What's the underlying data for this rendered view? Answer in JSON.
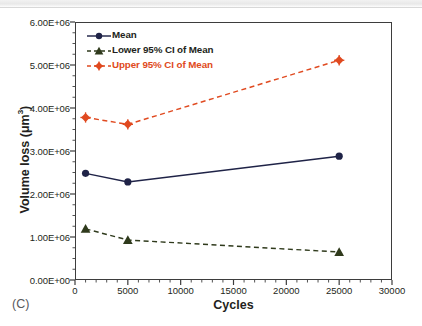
{
  "panel": {
    "label": "(C)"
  },
  "chart_data": {
    "type": "line",
    "title": "",
    "subtitle": "",
    "xlabel": "Cycles",
    "ylabel": "Volume loss (μm³)",
    "ylabel_base": "Volume loss (μm",
    "ylabel_sup": "3",
    "ylabel_close": ")",
    "x": [
      1000,
      5000,
      25000
    ],
    "xlim": [
      0,
      30000
    ],
    "ylim": [
      0,
      6000000
    ],
    "grid": false,
    "legend_position": "top-left",
    "xticks": [
      0,
      5000,
      10000,
      15000,
      20000,
      25000,
      30000
    ],
    "xtick_labels": [
      "0",
      "5000",
      "10000",
      "15000",
      "20000",
      "25000",
      "30000"
    ],
    "yticks": [
      0,
      1000000,
      2000000,
      3000000,
      4000000,
      5000000,
      6000000
    ],
    "ytick_labels": [
      "0.00E+00",
      "1.00E+06",
      "2.00E+06",
      "3.00E+06",
      "4.00E+06",
      "5.00E+06",
      "6.00E+06"
    ],
    "x_minor_tick_step": 1000,
    "y_minor_tick_step": 250000,
    "series": [
      {
        "name": "Mean",
        "values": [
          2480000,
          2280000,
          2880000
        ],
        "color": "#1f2347",
        "marker": "circle",
        "linestyle": "solid"
      },
      {
        "name": "Lower 95% CI of Mean",
        "values": [
          1190000,
          930000,
          650000
        ],
        "color": "#2f3a1c",
        "marker": "triangle",
        "linestyle": "dashed"
      },
      {
        "name": "Upper 95% CI of Mean",
        "values": [
          3780000,
          3620000,
          5110000
        ],
        "color": "#e04a20",
        "marker": "diamond",
        "linestyle": "dashed"
      }
    ]
  },
  "colors": {
    "mean": "#1f2347",
    "lower_ci": "#2f3a1c",
    "upper_ci": "#e04a20",
    "axis": "#3d3d3d",
    "text": "#231f20"
  }
}
